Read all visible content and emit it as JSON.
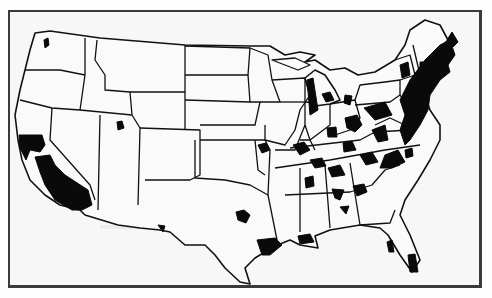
{
  "map": {
    "type": "choropleth-outline",
    "subject": "Contiguous United States",
    "style": "black and white scanned print",
    "legend": null,
    "labels": [],
    "colors": {
      "border": "#111111",
      "fill": "#fafafa",
      "shaded": "#0a0a0a",
      "background": "#f7f7f7"
    },
    "shaded_regions": [
      {
        "area": "Seattle, WA"
      },
      {
        "area": "San Francisco Bay / Sacramento, CA"
      },
      {
        "area": "Central Valley & Southern California"
      },
      {
        "area": "Salt Lake City, UT"
      },
      {
        "area": "El Paso, TX"
      },
      {
        "area": "Dallas-Fort Worth, TX"
      },
      {
        "area": "Houston, TX"
      },
      {
        "area": "New Orleans / Baton Rouge, LA"
      },
      {
        "area": "Kansas City, MO"
      },
      {
        "area": "St. Louis, MO"
      },
      {
        "area": "Memphis, TN"
      },
      {
        "area": "Birmingham, AL"
      },
      {
        "area": "Montgomery, AL"
      },
      {
        "area": "Atlanta, GA"
      },
      {
        "area": "Tampa-Orlando, FL"
      },
      {
        "area": "Miami, FL"
      },
      {
        "area": "Chicago / Milwaukee corridor"
      },
      {
        "area": "Detroit & Michigan cities"
      },
      {
        "area": "Indianapolis, IN"
      },
      {
        "area": "Ohio cities"
      },
      {
        "area": "Louisville, KY"
      },
      {
        "area": "Nashville / Knoxville, TN"
      },
      {
        "area": "North Carolina Piedmont"
      },
      {
        "area": "Western Pennsylvania / Pittsburgh"
      },
      {
        "area": "Upstate New York"
      },
      {
        "area": "Northeast corridor (Boston-Washington)"
      },
      {
        "area": "Maine coast"
      }
    ]
  }
}
